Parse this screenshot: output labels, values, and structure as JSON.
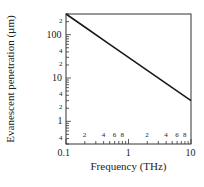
{
  "chart_data": {
    "type": "line",
    "title": "",
    "xlabel": "Frequency (THz)",
    "ylabel": "Evanescent penetration (µm)",
    "xscale": "log",
    "yscale": "log",
    "xlim": [
      0.1,
      10
    ],
    "ylim": [
      0.3,
      300
    ],
    "grid": false,
    "legend": null,
    "x_major_ticks": [
      "0.1",
      "1",
      "10"
    ],
    "x_minor_tick_labels": [
      "2",
      "4",
      "6",
      "8",
      "2",
      "4",
      "6",
      "8"
    ],
    "y_major_ticks": [
      "1",
      "10",
      "100"
    ],
    "y_minor_tick_labels": [
      "4",
      "2",
      "4",
      "2",
      "4",
      "2"
    ],
    "series": [
      {
        "name": "Evanescent penetration",
        "x": [
          0.1,
          0.2,
          0.5,
          1,
          2,
          5,
          10
        ],
        "y": [
          300,
          150,
          60,
          30,
          15,
          6,
          3
        ]
      }
    ],
    "line_color": "#1a1a1a"
  }
}
